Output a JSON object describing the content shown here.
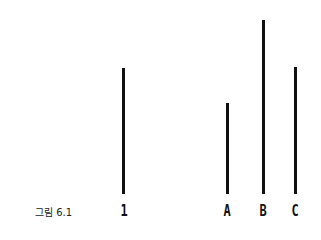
{
  "caption": "그림 6.1",
  "diagram": {
    "type": "line-length comparison (Asch conformity)",
    "lines": [
      {
        "id": "reference",
        "label": "1",
        "x": 123,
        "top": 68,
        "bottom": 194
      },
      {
        "id": "A",
        "label": "A",
        "x": 227,
        "top": 103,
        "bottom": 194
      },
      {
        "id": "B",
        "label": "B",
        "x": 263,
        "top": 20,
        "bottom": 194
      },
      {
        "id": "C",
        "label": "C",
        "x": 295,
        "top": 67,
        "bottom": 194
      }
    ]
  }
}
